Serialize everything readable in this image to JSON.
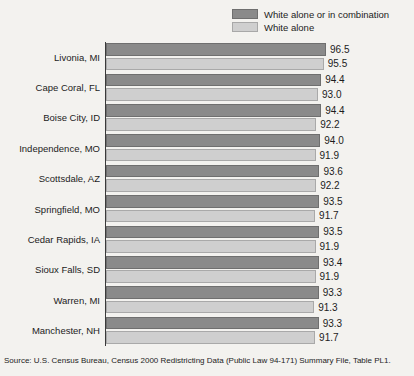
{
  "legend": {
    "position": "top-right",
    "items": [
      {
        "label": "White alone or in combination",
        "color": "#8a8a8a",
        "swatch": "dark"
      },
      {
        "label": "White alone",
        "color": "#cfcfcf",
        "swatch": "light"
      }
    ]
  },
  "source": {
    "text": "Source: U.S. Census Bureau, Census 2000 Redistricting Data (Public Law 94-171) Summary File, Table PL1."
  },
  "chart_data": {
    "type": "bar",
    "orientation": "horizontal",
    "title": "",
    "subtitle": "",
    "xlabel": "",
    "ylabel": "",
    "grid": false,
    "xlim": [
      0,
      100
    ],
    "axis_visible": "left",
    "legend_position": "top-right",
    "categories": [
      "Livonia, MI",
      "Cape Coral, FL",
      "Boise City, ID",
      "Independence, MO",
      "Scottsdale, AZ",
      "Springfield, MO",
      "Cedar Rapids, IA",
      "Sioux Falls, SD",
      "Warren, MI",
      "Manchester, NH"
    ],
    "series": [
      {
        "name": "White alone or in combination",
        "color": "#8a8a8a",
        "values": [
          96.5,
          94.4,
          94.4,
          94.0,
          93.6,
          93.5,
          93.5,
          93.4,
          93.3,
          93.3
        ]
      },
      {
        "name": "White alone",
        "color": "#cfcfcf",
        "values": [
          95.5,
          93.0,
          92.2,
          91.9,
          92.2,
          91.7,
          91.9,
          91.9,
          91.3,
          91.7
        ]
      }
    ]
  }
}
